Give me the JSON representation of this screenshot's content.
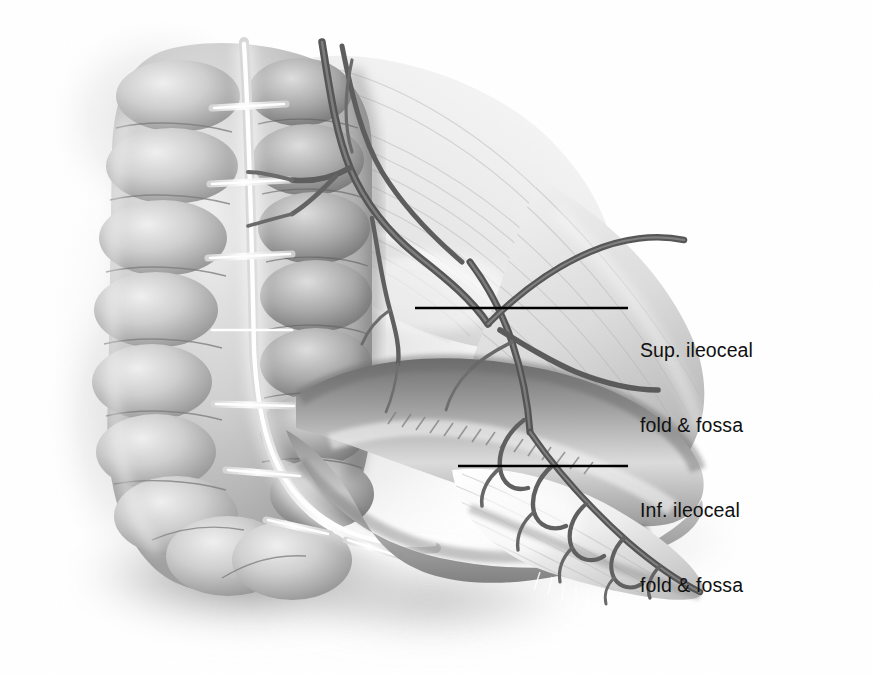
{
  "figure": {
    "style": "grayscale airbrush medical illustration",
    "background_color": "#ffffff",
    "ink_color": "#111111",
    "palette": {
      "bowel_mid": "#9a9a9a",
      "bowel_dark": "#6f6f6f",
      "bowel_light": "#e8e8e8",
      "taenia_highlight": "#ffffff",
      "vessel": "#595959",
      "vessel_dark": "#3f3f3f",
      "mesentery_light": "#f2f2f2",
      "mesentery_shade": "#c9c9c9",
      "cast_shadow": "#8c8c8c",
      "leader_line": "#000000"
    }
  },
  "labels": [
    {
      "id": "sup-ileocecal",
      "name": "superior-ileocecal-fold-label",
      "line1": "Sup. ileoceal",
      "line2": "fold & fossa",
      "text_x": 640,
      "text_y": 288,
      "leader": {
        "x1": 415,
        "y1": 308,
        "x2": 628,
        "y2": 308
      }
    },
    {
      "id": "inf-ileocecal",
      "name": "inferior-ileocecal-fold-label",
      "line1": "Inf. ileoceal",
      "line2": "fold & fossa",
      "text_x": 640,
      "text_y": 448,
      "leader": {
        "x1": 458,
        "y1": 466,
        "x2": 628,
        "y2": 466
      }
    }
  ],
  "structures": [
    {
      "name": "ascending-colon",
      "description": "haustrated ascending colon, left side, vertical"
    },
    {
      "name": "cecum",
      "description": "rounded cecal pouch, lower left"
    },
    {
      "name": "taenia-coli",
      "description": "pale longitudinal muscular band with bright highlight running down the colon"
    },
    {
      "name": "terminal-ileum",
      "description": "tubular small bowel loop crossing from left to right, mid-lower"
    },
    {
      "name": "mesentery-of-ileum",
      "description": "fan-shaped translucent mesentery with striations, right side"
    },
    {
      "name": "superior-ileocecal-fold",
      "description": "translucent vascular peritoneal fold above the terminal ileum"
    },
    {
      "name": "inferior-ileocecal-fold",
      "description": "bloodless peritoneal fold below the terminal ileum"
    },
    {
      "name": "ileocolic-artery",
      "description": "main vessel trunk descending from top, branching over the folds"
    },
    {
      "name": "vascular-arcade",
      "description": "marginal arcade with vasa recta along the ileal mesenteric border"
    }
  ]
}
